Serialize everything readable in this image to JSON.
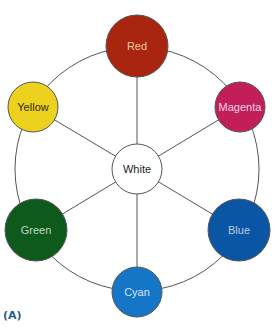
{
  "diagram": {
    "panel_label": "(A)",
    "center": {
      "label": "White",
      "fill": "#ffffff",
      "text_color": "#222222",
      "cx": 137,
      "cy": 169,
      "r": 25
    },
    "ring": {
      "cx": 137,
      "cy": 169,
      "r": 122,
      "stroke": "#555555"
    },
    "nodes": [
      {
        "id": "red",
        "label": "Red",
        "fill": "#a9250f",
        "text_color": "#f3c9a8",
        "cx": 137,
        "cy": 46,
        "r": 31
      },
      {
        "id": "magenta",
        "label": "Magenta",
        "fill": "#c21e5a",
        "text_color": "#f5d6e2",
        "cx": 240,
        "cy": 107,
        "r": 25
      },
      {
        "id": "blue",
        "label": "Blue",
        "fill": "#0b55a5",
        "text_color": "#b9cde8",
        "cx": 239,
        "cy": 230,
        "r": 31
      },
      {
        "id": "cyan",
        "label": "Cyan",
        "fill": "#1576c8",
        "text_color": "#d4e6f6",
        "cx": 137,
        "cy": 292,
        "r": 25
      },
      {
        "id": "green",
        "label": "Green",
        "fill": "#0e5a1d",
        "text_color": "#bfd9c2",
        "cx": 36,
        "cy": 230,
        "r": 31
      },
      {
        "id": "yellow",
        "label": "Yellow",
        "fill": "#ecd21f",
        "text_color": "#2a2a10",
        "cx": 33,
        "cy": 107,
        "r": 25
      }
    ]
  }
}
